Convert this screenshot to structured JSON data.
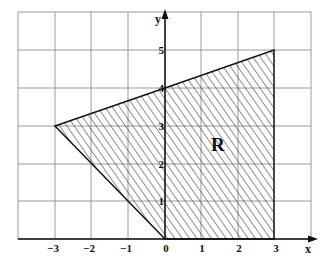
{
  "diagram": {
    "type": "coordinate-plane-region",
    "axes": {
      "x_label": "x",
      "y_label": "y",
      "x_ticks": [
        "−3",
        "−2",
        "−1",
        "0",
        "1",
        "2",
        "3"
      ],
      "y_ticks": [
        "1",
        "2",
        "3",
        "4",
        "5"
      ],
      "x_range": [
        -4,
        4
      ],
      "y_range": [
        0,
        6
      ]
    },
    "grid": true,
    "region": {
      "label": "R",
      "vertices": [
        [
          -3,
          3
        ],
        [
          0,
          4
        ],
        [
          3,
          5
        ],
        [
          3,
          0
        ],
        [
          0,
          0
        ]
      ],
      "fill": "diagonal-hatch"
    },
    "colors": {
      "grid": "#9a9a9a",
      "axis": "#111111",
      "boundary": "#111111",
      "hatch": "#333333"
    }
  }
}
